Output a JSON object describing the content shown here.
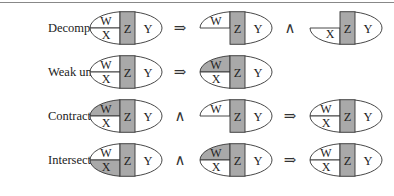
{
  "colors": {
    "shade": "#a9a9a9",
    "stroke": "#333333",
    "background": "#ffffff"
  },
  "variables": {
    "w": "W",
    "x": "X",
    "z": "Z",
    "y": "Y"
  },
  "operators": {
    "implies": "⇒",
    "and": "∧"
  },
  "rows": [
    {
      "label": "Decomposition:",
      "terms": [
        {
          "kind": "full",
          "shaded_w": false,
          "shaded_x": false
        },
        {
          "kind": "w-only",
          "shaded_w": false
        },
        {
          "kind": "x-only",
          "shaded_x": false
        }
      ],
      "ops": [
        "⇒",
        "∧"
      ]
    },
    {
      "label": "Weak union:",
      "terms": [
        {
          "kind": "full",
          "shaded_w": false,
          "shaded_x": false
        },
        {
          "kind": "full",
          "shaded_w": true,
          "shaded_x": false
        }
      ],
      "ops": [
        "⇒"
      ]
    },
    {
      "label": "Contraction:",
      "terms": [
        {
          "kind": "full",
          "shaded_w": true,
          "shaded_x": false
        },
        {
          "kind": "w-only",
          "shaded_w": false
        },
        {
          "kind": "full",
          "shaded_w": false,
          "shaded_x": false
        }
      ],
      "ops": [
        "∧",
        "⇒"
      ]
    },
    {
      "label": "Intersection:",
      "terms": [
        {
          "kind": "full",
          "shaded_w": false,
          "shaded_x": true
        },
        {
          "kind": "full",
          "shaded_w": true,
          "shaded_x": false
        },
        {
          "kind": "full",
          "shaded_w": false,
          "shaded_x": false
        }
      ],
      "ops": [
        "∧",
        "⇒"
      ]
    }
  ]
}
